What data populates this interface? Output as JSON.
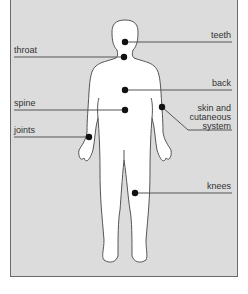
{
  "diagram": {
    "type": "body-map",
    "colors": {
      "panel": "#dcdcdc",
      "figure": "#ffffff",
      "outline": "#555555",
      "dot": "#111111",
      "leader": "#555555"
    },
    "labels": {
      "teeth": "teeth",
      "throat": "throat",
      "back": "back",
      "spine": "spine",
      "skin_1": "skin and",
      "skin_2": "cutaneous",
      "skin_3": "system",
      "joints": "joints",
      "knees": "knees"
    }
  }
}
